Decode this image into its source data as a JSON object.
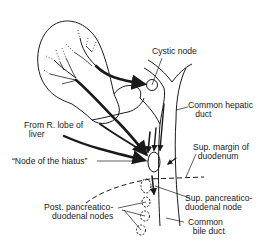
{
  "figure": {
    "type": "anatomical-diagram",
    "colors": {
      "ink": "#1a1a1a",
      "background": "#ffffff"
    }
  },
  "labels": {
    "cystic_node": "Cystic node",
    "common_hepatic_duct": "Common hepatic\n   duct",
    "from_r_lobe": "From R. lobe of\n  liver",
    "node_of_hiatus": "“Node of the hiatus”",
    "sup_margin_duodenum": "Sup. margin of\n  duodenum",
    "sup_pancreaticoduodenal_node": "Sup. pancreatico-\nduodenal node",
    "post_pancreaticoduodenal_nodes": "Post. pancreatico-\n duodenal nodes",
    "common_bile_duct": "Common\n  bile duct"
  }
}
